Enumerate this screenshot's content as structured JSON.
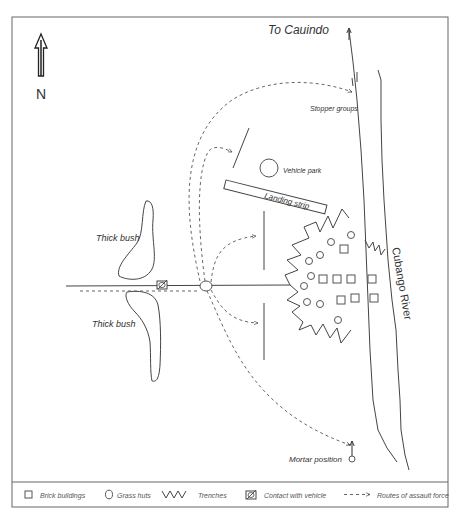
{
  "diagram": {
    "compass": {
      "label": "N",
      "icon": "north-arrow-icon"
    },
    "labels": {
      "to_cauindo": "To Cauindo",
      "stopper_groups": "Stopper groups",
      "vehicle_park": "Vehicle park",
      "landing_strip": "Landing strip",
      "thick_bush_north": "Thick bush",
      "thick_bush_south": "Thick bush",
      "river": "Cubango River",
      "mortar_position": "Mortar position"
    },
    "legend": [
      {
        "icon": "square-icon",
        "label": "Brick buildings"
      },
      {
        "icon": "circle-icon",
        "label": "Grass huts"
      },
      {
        "icon": "zigzag-icon",
        "label": "Trenches"
      },
      {
        "icon": "vehicle-contact-icon",
        "label": "Contact with vehicle"
      },
      {
        "icon": "dashed-arrow-icon",
        "label": "Routes of assault force"
      }
    ],
    "colors": {
      "line": "#444444",
      "text": "#333333",
      "background": "#ffffff"
    }
  }
}
